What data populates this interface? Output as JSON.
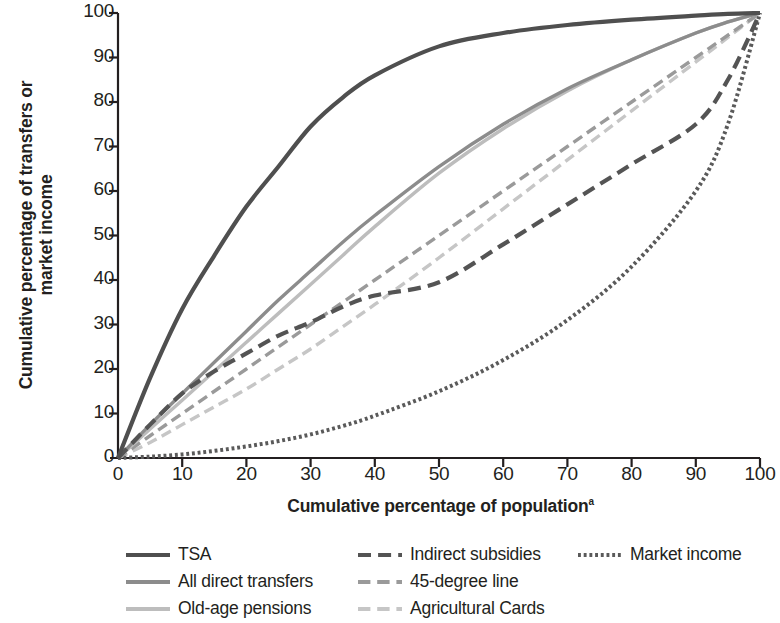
{
  "chart_data": {
    "type": "line",
    "title": "",
    "xlabel": "Cumulative percentage of population",
    "xlabel_superscript": "a",
    "ylabel_line1": "Cumulative percentage of transfers or",
    "ylabel_line2": "market income",
    "xlim": [
      0,
      100
    ],
    "ylim": [
      0,
      100
    ],
    "grid": false,
    "legend_position": "below",
    "xticks": [
      0,
      10,
      20,
      30,
      40,
      50,
      60,
      70,
      80,
      90,
      100
    ],
    "yticks": [
      0,
      10,
      20,
      30,
      40,
      50,
      60,
      70,
      80,
      90,
      100
    ],
    "x": [
      0,
      5,
      10,
      15,
      20,
      25,
      30,
      35,
      40,
      50,
      60,
      70,
      80,
      90,
      95,
      100
    ],
    "series": [
      {
        "name": "TSA",
        "color": "#4f4f4f",
        "style": "solid",
        "width": 4.2,
        "values": [
          0,
          18,
          33.5,
          45.5,
          56.5,
          65.5,
          74.5,
          81,
          86,
          92.5,
          95.5,
          97.3,
          98.5,
          99.4,
          99.8,
          100
        ]
      },
      {
        "name": "All direct transfers",
        "color": "#8c8c8c",
        "style": "solid",
        "width": 3.4,
        "values": [
          0,
          7.5,
          14.5,
          21.5,
          28.5,
          35.5,
          42,
          48.5,
          54.5,
          65.5,
          75,
          83,
          89.5,
          95.5,
          98,
          100
        ]
      },
      {
        "name": "Old-age pensions",
        "color": "#bdbdbd",
        "style": "solid",
        "width": 3.4,
        "values": [
          0,
          6.5,
          13,
          19.5,
          26,
          32.5,
          39,
          45.5,
          52,
          64,
          74,
          82.5,
          89.5,
          95.5,
          98,
          100
        ]
      },
      {
        "name": "Indirect subsidies",
        "color": "#545454",
        "style": "dashed",
        "width": 4.2,
        "values": [
          0,
          7.5,
          14.5,
          19.5,
          23.5,
          27.5,
          30.5,
          34,
          36.5,
          39.5,
          48,
          57,
          66,
          75,
          85,
          100
        ]
      },
      {
        "name": "45-degree line",
        "color": "#9a9a9a",
        "style": "dashed",
        "width": 3.4,
        "values": [
          0,
          5,
          10,
          15,
          20,
          25,
          30,
          35,
          40,
          50,
          60,
          70,
          80,
          90,
          95,
          100
        ]
      },
      {
        "name": "Agricultural Cards",
        "color": "#c6c6c6",
        "style": "dashed",
        "width": 3.4,
        "values": [
          0,
          3.5,
          7.5,
          11.5,
          15.5,
          20,
          24.5,
          29.5,
          34.5,
          45,
          56,
          67,
          78,
          89,
          94.5,
          100
        ]
      },
      {
        "name": "Market income",
        "color": "#5a5a5a",
        "style": "dotted",
        "width": 4.0,
        "values": [
          0,
          0.3,
          0.8,
          1.6,
          2.6,
          3.8,
          5.3,
          7.2,
          9.5,
          15,
          22,
          31,
          43,
          60,
          75,
          100
        ]
      }
    ]
  },
  "axis": {
    "y_label_line1": "Cumulative percentage of transfers or",
    "y_label_line2": "market income",
    "x_label": "Cumulative percentage of population",
    "x_label_note": "a",
    "y_tick_labels": [
      "100",
      "90",
      "80",
      "70",
      "60",
      "50",
      "40",
      "30",
      "20",
      "10",
      "0"
    ],
    "x_tick_labels": [
      "0",
      "10",
      "20",
      "30",
      "40",
      "50",
      "60",
      "70",
      "80",
      "90",
      "100"
    ]
  },
  "legend": {
    "items": [
      {
        "label": "TSA",
        "series": "TSA",
        "column": 0,
        "row": 0
      },
      {
        "label": "All direct transfers",
        "series": "All direct transfers",
        "column": 0,
        "row": 1
      },
      {
        "label": "Old-age pensions",
        "series": "Old-age pensions",
        "column": 0,
        "row": 2
      },
      {
        "label": "Indirect subsidies",
        "series": "Indirect subsidies",
        "column": 1,
        "row": 0
      },
      {
        "label": "45-degree line",
        "series": "45-degree line",
        "column": 1,
        "row": 1
      },
      {
        "label": "Agricultural Cards",
        "series": "Agricultural Cards",
        "column": 1,
        "row": 2
      },
      {
        "label": "Market income",
        "series": "Market income",
        "column": 2,
        "row": 0
      }
    ]
  },
  "colors": {
    "axis": "#231f20",
    "background": "#ffffff",
    "text": "#231f20"
  }
}
